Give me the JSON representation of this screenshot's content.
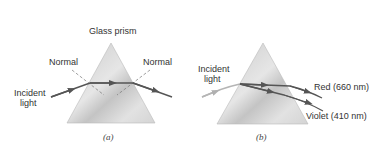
{
  "panels": [
    {
      "id": "a",
      "caption": "(a)",
      "title": "Glass prism",
      "normal_left": "Normal",
      "normal_right": "Normal",
      "incident_line1": "Incident",
      "incident_line2": "light"
    },
    {
      "id": "b",
      "caption": "(b)",
      "incident_line1": "Incident",
      "incident_line2": "light",
      "red_label": "Red (660 nm)",
      "violet_label": "Violet (410 nm)"
    }
  ],
  "colors": {
    "prism_light": "#e4e4e4",
    "prism_dark": "#b8b8b8",
    "ray": "#555555",
    "incident_b": "#b5b5b5",
    "normal_dash": "#777777"
  }
}
